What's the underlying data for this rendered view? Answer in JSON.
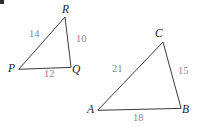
{
  "figure": {
    "width": 199,
    "height": 133,
    "background": "#ffffff",
    "stroke_color": "#3a3a3a",
    "vertex_label_color": "#1b1b1b",
    "side_label_color": "#8a8a8a",
    "corner_mark": {
      "present": true,
      "x": 1,
      "y": 11,
      "size": 4,
      "color": "#2e2e2e"
    }
  },
  "triangles": [
    {
      "name": "triangle-pqr",
      "vertices": [
        {
          "id": "P",
          "label": "P",
          "x": 19,
          "y": 69,
          "label_x": 8,
          "label_y": 63
        },
        {
          "id": "Q",
          "label": "Q",
          "x": 71,
          "y": 67,
          "label_x": 72,
          "label_y": 64
        },
        {
          "id": "R",
          "label": "R",
          "x": 65,
          "y": 17,
          "label_x": 62,
          "label_y": 4
        }
      ],
      "sides": [
        {
          "id": "PR",
          "label": "14",
          "label_x": 29,
          "label_y": 29
        },
        {
          "id": "RQ",
          "label": "10",
          "label_x": 76,
          "label_y": 34
        },
        {
          "id": "PQ",
          "label": "12",
          "label_x": 44,
          "label_y": 69
        }
      ]
    },
    {
      "name": "triangle-abc",
      "vertices": [
        {
          "id": "A",
          "label": "A",
          "x": 98,
          "y": 110,
          "label_x": 87,
          "label_y": 104
        },
        {
          "id": "B",
          "label": "B",
          "x": 181,
          "y": 108,
          "label_x": 182,
          "label_y": 104
        },
        {
          "id": "C",
          "label": "C",
          "x": 163,
          "y": 42,
          "label_x": 155,
          "label_y": 28
        }
      ],
      "sides": [
        {
          "id": "AC",
          "label": "21",
          "label_x": 112,
          "label_y": 64
        },
        {
          "id": "CB",
          "label": "15",
          "label_x": 178,
          "label_y": 66
        },
        {
          "id": "AB",
          "label": "18",
          "label_x": 133,
          "label_y": 113
        }
      ]
    }
  ]
}
